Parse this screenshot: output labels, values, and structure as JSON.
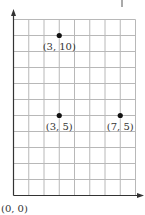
{
  "chart_data": {
    "type": "scatter",
    "title": "",
    "xlabel": "",
    "ylabel": "",
    "xlim": [
      0,
      8
    ],
    "ylim": [
      0,
      11
    ],
    "grid": true,
    "legend": null,
    "origin_label": "(0, 0)",
    "points": [
      {
        "x": 3,
        "y": 10,
        "label": "(3, 10)"
      },
      {
        "x": 3,
        "y": 5,
        "label": "(3, 5)"
      },
      {
        "x": 7,
        "y": 5,
        "label": "(7, 5)"
      }
    ]
  },
  "colors": {
    "grid": "#b8b8b8",
    "axis": "#333333",
    "point": "#111111"
  }
}
